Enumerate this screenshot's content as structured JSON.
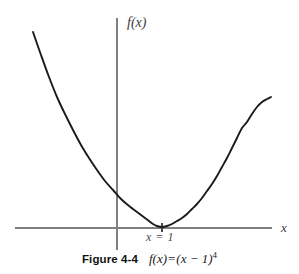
{
  "figure": {
    "background_color": "#ffffff",
    "caption": {
      "figure_number": "Figure 4-4",
      "formula_plain": "f(x) = (x − 1)⁴",
      "formula_lhs": "f(x)",
      "formula_equals": "=",
      "formula_base": "(x − 1)",
      "formula_exponent": "4"
    },
    "annotations": {
      "vertex_label": "x = 1"
    },
    "axis_label_y": "f(x)",
    "axis_label_x": "x"
  },
  "chart_data": {
    "type": "line",
    "title": "",
    "subtitle": "",
    "xlabel": "x",
    "ylabel": "f(x)",
    "function": "f(x) = (x - 1)^4",
    "grid": false,
    "legend": null,
    "legend_position": "none",
    "curve_color": "#1a1a1a",
    "axis_color": "#808080",
    "curve_width_px": 1.9,
    "axis_width_px": 1.2,
    "xlim": [
      -2.05,
      2.55
    ],
    "ylim": [
      -0.55,
      4.5
    ],
    "x_axis_y_value": 0,
    "y_axis_x_value": 0,
    "minimum": {
      "x": 1,
      "y": 0
    },
    "tick_marks_x": [
      1
    ],
    "tick_label_x": "x = 1",
    "x": [
      -2.05,
      -1.8,
      -1.6,
      -1.4,
      -1.2,
      -1.0,
      -0.8,
      -0.6,
      -0.4,
      -0.2,
      0.0,
      0.2,
      0.4,
      0.6,
      0.8,
      1.0,
      1.2,
      1.4,
      1.6,
      1.8,
      2.0,
      2.2,
      2.4,
      2.55
    ],
    "y": [
      83.0,
      62.5,
      45.7,
      33.2,
      23.4,
      16.0,
      10.5,
      6.55,
      3.84,
      2.07,
      1.0,
      0.41,
      0.13,
      0.026,
      0.0016,
      0.0,
      0.0016,
      0.026,
      0.13,
      0.41,
      1.0,
      2.07,
      3.84,
      5.9
    ],
    "y_displayed_clip": 4.5,
    "series": [
      {
        "name": "f(x) = (x - 1)^4",
        "color": "#1a1a1a",
        "points_px": [
          [
            33,
            32
          ],
          [
            41,
            55
          ],
          [
            49,
            77
          ],
          [
            57,
            97
          ],
          [
            65,
            114
          ],
          [
            73,
            130
          ],
          [
            81,
            145
          ],
          [
            89,
            158
          ],
          [
            97,
            170
          ],
          [
            105,
            181
          ],
          [
            113,
            190
          ],
          [
            121,
            199
          ],
          [
            129,
            206
          ],
          [
            133,
            209
          ],
          [
            137,
            212
          ],
          [
            141,
            215
          ],
          [
            145,
            218
          ],
          [
            149,
            221
          ],
          [
            153,
            224
          ],
          [
            157,
            226
          ],
          [
            162,
            227
          ],
          [
            167,
            226
          ],
          [
            172,
            224
          ],
          [
            177,
            221
          ],
          [
            182,
            218
          ],
          [
            187,
            214
          ],
          [
            192,
            209
          ],
          [
            197,
            204
          ],
          [
            202,
            198
          ],
          [
            207,
            191
          ],
          [
            212,
            184
          ],
          [
            217,
            176
          ],
          [
            222,
            167
          ],
          [
            227,
            158
          ],
          [
            232,
            148
          ],
          [
            237,
            138
          ],
          [
            242,
            128
          ],
          [
            247,
            122
          ],
          [
            252,
            114
          ],
          [
            257,
            107
          ],
          [
            262,
            102
          ],
          [
            267,
            99
          ],
          [
            271,
            97
          ]
        ]
      }
    ]
  },
  "geometry": {
    "y_axis": {
      "x": 117,
      "y_top": 18,
      "y_bottom": 250
    },
    "x_axis": {
      "y": 228,
      "x_left": 15,
      "x_right": 272
    },
    "vertex_tick": {
      "x": 162,
      "y_top": 223,
      "y_bottom": 232
    }
  }
}
